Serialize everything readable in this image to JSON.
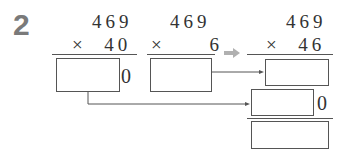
{
  "problem_number": "2",
  "columns": [
    {
      "multiplicand": "469",
      "multiplier_row": "×  40",
      "trailing_zero": "0"
    },
    {
      "multiplicand": "469",
      "multiplier_row": "×     6"
    },
    {
      "multiplicand": "469",
      "multiplier_row": "×  46"
    }
  ],
  "partial_product_zero": "0",
  "colors": {
    "number_gray": "#7a7a7a",
    "arrow_gray": "#b0b0b0",
    "line": "#555555"
  }
}
